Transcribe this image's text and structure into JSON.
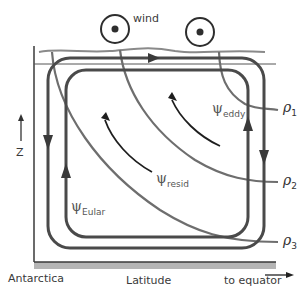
{
  "diagram": {
    "wind_label": "wind",
    "z_label": "Z",
    "x_left_label": "Antarctica",
    "x_center_label": "Latitude",
    "x_right_label": "to equator",
    "density_labels": [
      {
        "symbol": "ρ",
        "sub": "1"
      },
      {
        "symbol": "ρ",
        "sub": "2"
      },
      {
        "symbol": "ρ",
        "sub": "3"
      }
    ],
    "streamfunctions": [
      {
        "symbol": "ψ",
        "sub": "eddy"
      },
      {
        "symbol": "ψ",
        "sub": "resid"
      },
      {
        "symbol": "ψ",
        "sub": "Eular"
      }
    ],
    "icons": [
      "wind-out-of-page-icon",
      "wind-out-of-page-icon"
    ],
    "colors": {
      "cell_stroke": "#4a4a4a",
      "isopycnal_stroke": "#6e6e6e",
      "surface_stroke": "#8a8a8a",
      "axis_stroke": "#3a3a3a",
      "ground_fill": "#b5b5b5",
      "arrow_stroke": "#1e1e1e"
    }
  }
}
